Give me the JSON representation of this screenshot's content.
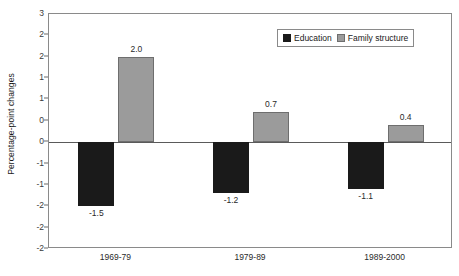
{
  "chart_data": {
    "type": "bar",
    "title": "",
    "xlabel": "",
    "ylabel": "Percentage-point changes",
    "categories": [
      "1969-79",
      "1979-89",
      "1989-2000"
    ],
    "series": [
      {
        "name": "Education",
        "color": "#1a1a1a",
        "values": [
          -1.5,
          -1.2,
          -1.1
        ],
        "labels": [
          "-1.5",
          "-1.2",
          "-1.1"
        ]
      },
      {
        "name": "Family structure",
        "color": "#9b9b9b",
        "values": [
          2.0,
          0.7,
          0.4
        ],
        "labels": [
          "2.0",
          "0.7",
          "0.4"
        ]
      }
    ],
    "ylim": [
      -2.5,
      3.0
    ],
    "ytick_values": [
      3.0,
      2.5,
      2.0,
      1.5,
      1.0,
      0.5,
      0.0,
      -0.5,
      -1.0,
      -1.5,
      -2.0,
      -2.5
    ],
    "ytick_labels": [
      "3",
      "2",
      "2",
      "1",
      "1",
      "0",
      "0",
      "-1",
      "-1",
      "-2",
      "-2",
      "-2"
    ],
    "grid": false,
    "legend_position": "top-right-inside"
  },
  "legend": {
    "items": [
      {
        "label": "Education",
        "swatch": "black-square-swatch"
      },
      {
        "label": "Family structure",
        "swatch": "gray-square-swatch"
      }
    ]
  },
  "axes": {
    "y_title": "Percentage-point changes"
  }
}
